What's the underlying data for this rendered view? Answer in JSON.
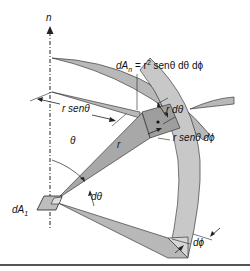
{
  "figure": {
    "colors": {
      "shade": "#b8b8b8",
      "shade_light": "#cfcfcf",
      "stroke": "#222222",
      "background": "#ffffff"
    },
    "labels": {
      "normal": "n",
      "area_element_eq_lhs": "dA",
      "area_element_eq_sub": "n",
      "area_element_eq_rhs_1": " = r",
      "area_element_eq_sup": "2",
      "area_element_eq_rhs_2": " senθ dθ dϕ",
      "r_dtheta": "r dθ",
      "r_sentheta_left": "r senθ",
      "r_sentheta_dphi": "r senθ dϕ",
      "radius": "r",
      "theta": "θ",
      "dtheta": "dθ",
      "source_area": "dA",
      "source_area_sub": "1",
      "dphi": "dϕ"
    }
  }
}
